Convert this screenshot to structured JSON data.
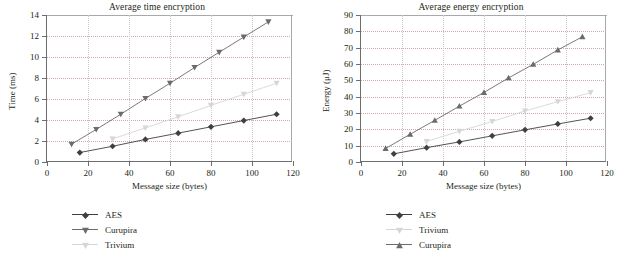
{
  "figure": {
    "axis_color": "#6d6e70",
    "grid_color": "#c9a9a9",
    "colors": {
      "aes": "#3f3f41",
      "curupira": "#6b6b6d",
      "trivium": "#d6d6d8"
    }
  },
  "chart_data": [
    {
      "type": "line",
      "title": "Average time encryption",
      "xlabel": "Message size (bytes)",
      "ylabel": "Time (ms)",
      "xlim": [
        0,
        120
      ],
      "ylim": [
        0,
        14
      ],
      "xticks": [
        0,
        20,
        40,
        60,
        80,
        100,
        120
      ],
      "yticks": [
        0,
        2,
        4,
        6,
        8,
        10,
        12,
        14
      ],
      "grid": true,
      "legend_position": "below-left",
      "series": [
        {
          "name": "AES",
          "marker": "diamond",
          "color": "#3f3f41",
          "x": [
            16,
            32,
            48,
            64,
            80,
            96,
            112
          ],
          "values": [
            0.9,
            1.5,
            2.15,
            2.75,
            3.35,
            3.95,
            4.55
          ]
        },
        {
          "name": "Curupira",
          "marker": "triangle-down",
          "color": "#6b6b6d",
          "x": [
            12,
            24,
            36,
            48,
            60,
            72,
            84,
            96,
            108
          ],
          "values": [
            1.7,
            3.1,
            4.55,
            6.05,
            7.5,
            9.0,
            10.45,
            11.9,
            13.35
          ]
        },
        {
          "name": "Trivium",
          "marker": "triangle-down",
          "color": "#d6d6d8",
          "x": [
            32,
            48,
            64,
            80,
            96,
            112
          ],
          "values": [
            2.2,
            3.25,
            4.3,
            5.4,
            6.45,
            7.5
          ]
        }
      ]
    },
    {
      "type": "line",
      "title": "Average energy encryption",
      "xlabel": "Message size (bytes)",
      "ylabel": "Energy (μJ)",
      "xlim": [
        0,
        120
      ],
      "ylim": [
        0,
        90
      ],
      "xticks": [
        0,
        20,
        40,
        60,
        80,
        100,
        120
      ],
      "yticks": [
        0,
        10,
        20,
        30,
        40,
        50,
        60,
        70,
        80,
        90
      ],
      "grid": true,
      "legend_position": "below-left",
      "series": [
        {
          "name": "AES",
          "marker": "diamond",
          "color": "#3f3f41",
          "x": [
            16,
            32,
            48,
            64,
            80,
            96,
            112
          ],
          "values": [
            5.0,
            8.8,
            12.3,
            16.0,
            19.7,
            23.3,
            26.8
          ]
        },
        {
          "name": "Trivium",
          "marker": "triangle-down",
          "color": "#d6d6d8",
          "x": [
            32,
            48,
            64,
            80,
            96,
            112
          ],
          "values": [
            12.6,
            18.8,
            24.8,
            31.2,
            36.9,
            42.5
          ]
        },
        {
          "name": "Curupira",
          "marker": "triangle-up",
          "color": "#6b6b6d",
          "x": [
            12,
            24,
            36,
            48,
            60,
            72,
            84,
            96,
            108
          ],
          "values": [
            8.3,
            17.0,
            25.5,
            34.2,
            42.6,
            51.5,
            59.8,
            68.6,
            76.7
          ]
        }
      ]
    }
  ]
}
